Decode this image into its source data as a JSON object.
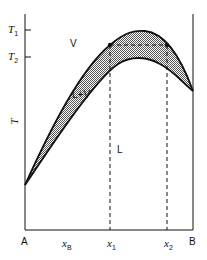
{
  "diagram": {
    "type": "phase-diagram",
    "axis": {
      "y_label": "T",
      "y_ticks": [
        {
          "label": "T",
          "sub": "1"
        },
        {
          "label": "T",
          "sub": "2"
        }
      ],
      "x_left": "A",
      "x_right": "B",
      "x_markers": [
        {
          "label": "x",
          "sub": "B"
        },
        {
          "label": "x",
          "sub": "1"
        },
        {
          "label": "x",
          "sub": "2"
        }
      ]
    },
    "regions": {
      "vapor": "V",
      "two_phase": "L+V",
      "liquid": "L"
    },
    "colors": {
      "line": "#111111",
      "fill": "#bdbdbd",
      "background": "#ffffff"
    }
  }
}
